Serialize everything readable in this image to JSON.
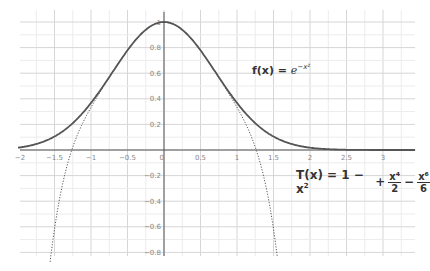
{
  "chart_data": {
    "type": "line",
    "title": "",
    "xlabel": "",
    "ylabel": "",
    "xlim": [
      -2.0,
      3.5
    ],
    "ylim": [
      -0.85,
      1.1
    ],
    "grid": true,
    "x_ticks": [
      "-2",
      "-1.5",
      "-1",
      "-0.5",
      "0",
      "0.5",
      "1",
      "1.5",
      "2",
      "2.5",
      "3"
    ],
    "y_ticks": [
      "1",
      "0.8",
      "0.6",
      "0.4",
      "0.2",
      "-0.2",
      "-0.4",
      "-0.6",
      "-0.8"
    ],
    "series": [
      {
        "name": "f(x) = e^{-x^2}",
        "style": "solid",
        "expression": "exp(-x^2)",
        "x": [
          -2,
          -1.5,
          -1,
          -0.5,
          0,
          0.5,
          1,
          1.5,
          2,
          2.5,
          3
        ],
        "values": [
          0.018,
          0.105,
          0.368,
          0.779,
          1.0,
          0.779,
          0.368,
          0.105,
          0.018,
          0.002,
          0.0
        ]
      },
      {
        "name": "T(x) = 1 - x^2 + x^4/2 - x^6/6",
        "style": "dotted",
        "expression": "1 - x^2 + x^4/2 - x^6/6",
        "x": [
          -1.55,
          -1.5,
          -1.25,
          -1,
          -0.5,
          0,
          0.5,
          1,
          1.25,
          1.5,
          1.55
        ],
        "values": [
          -0.81,
          -0.48,
          0.32,
          0.333,
          0.779,
          1.0,
          0.779,
          0.333,
          0.32,
          -0.48,
          -0.81
        ]
      }
    ],
    "annotations": [
      {
        "text": "f(x) = e^{-x^2}",
        "x": 1.2,
        "y": 0.55
      },
      {
        "text": "T(x) = 1 - x^2 + x^4/2 - x^6/6",
        "x": 1.8,
        "y": -0.25
      }
    ]
  },
  "labels": {
    "f_prefix": "f(x) = ",
    "f_base": "e",
    "f_exp": "−x²",
    "t_prefix": "T(x) = 1 − x",
    "t_sq": "2",
    "t_plus": "+",
    "t_num1": "x⁴",
    "t_den1": "2",
    "t_minus": "−",
    "t_num2": "x⁶",
    "t_den2": "6"
  }
}
